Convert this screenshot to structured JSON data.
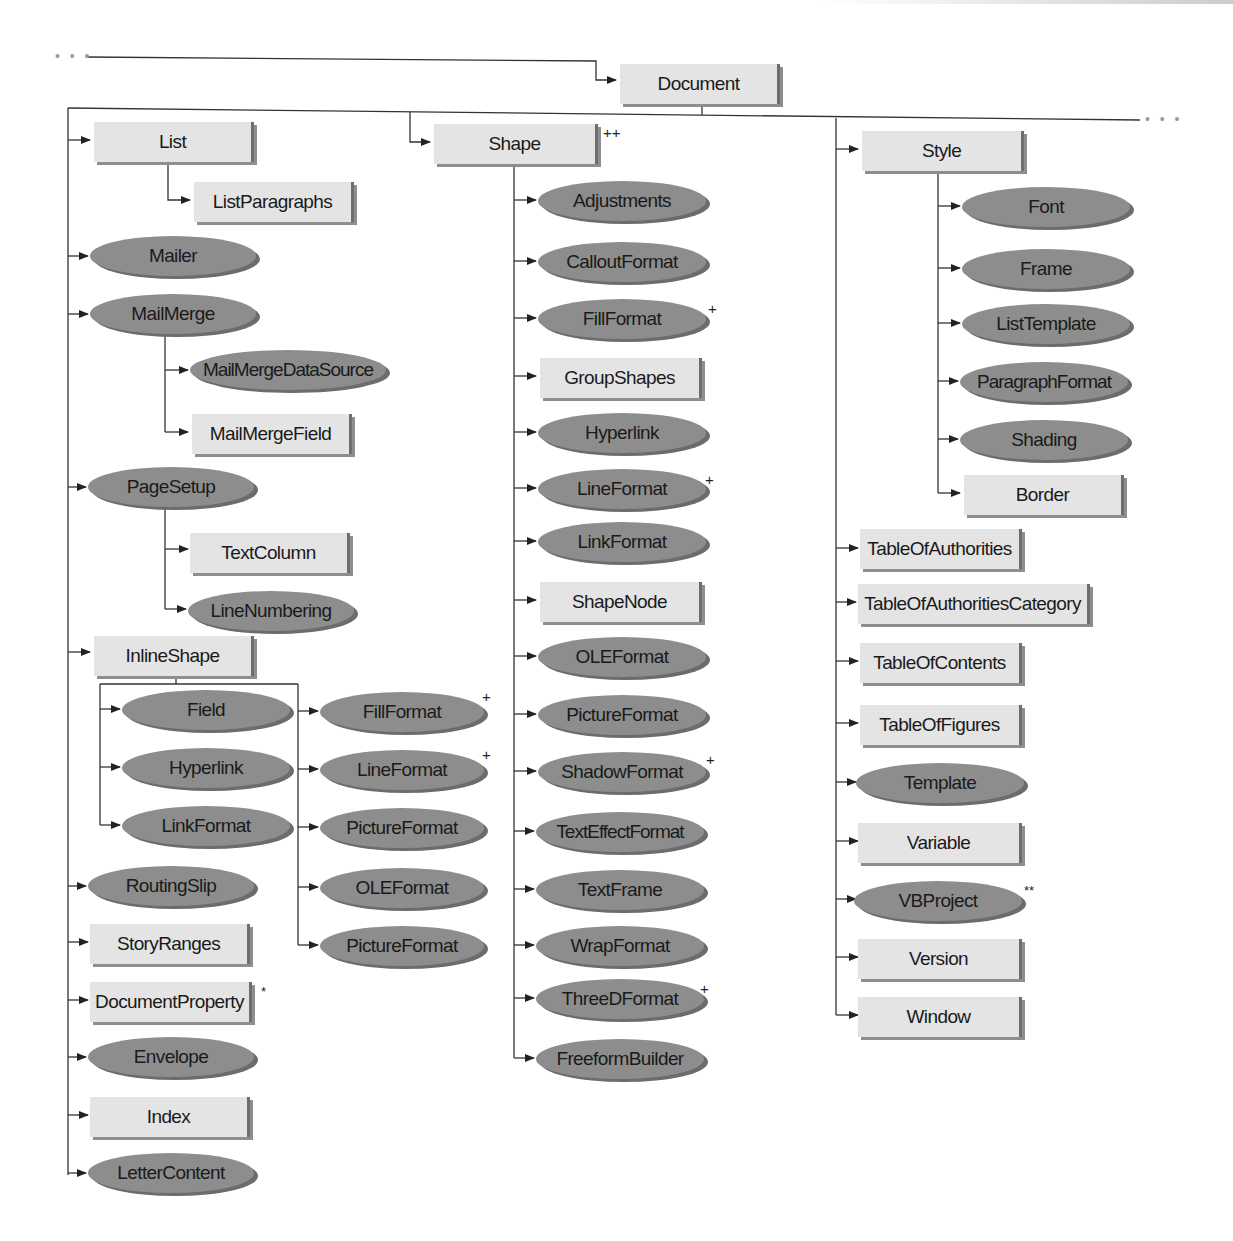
{
  "diagram": {
    "continuation_marker": "• • •",
    "root": {
      "label": "Document",
      "shape": "box"
    },
    "legend_marks": {
      "plus": "+",
      "double_plus": "++",
      "star": "*",
      "double_star": "**"
    },
    "left_column": {
      "list": {
        "label": "List",
        "shape": "box"
      },
      "list_paragraphs": {
        "label": "ListParagraphs",
        "shape": "box"
      },
      "mailer": {
        "label": "Mailer",
        "shape": "oval"
      },
      "mail_merge": {
        "label": "MailMerge",
        "shape": "oval"
      },
      "mail_merge_data_source": {
        "label": "MailMergeDataSource",
        "shape": "oval"
      },
      "mail_merge_field": {
        "label": "MailMergeField",
        "shape": "box"
      },
      "page_setup": {
        "label": "PageSetup",
        "shape": "oval"
      },
      "text_column": {
        "label": "TextColumn",
        "shape": "box"
      },
      "line_numbering": {
        "label": "LineNumbering",
        "shape": "oval"
      },
      "inline_shape": {
        "label": "InlineShape",
        "shape": "box"
      },
      "inline_field": {
        "label": "Field",
        "shape": "oval"
      },
      "inline_hyperlink": {
        "label": "Hyperlink",
        "shape": "oval"
      },
      "inline_link_format": {
        "label": "LinkFormat",
        "shape": "oval"
      },
      "inline_fill_format": {
        "label": "FillFormat",
        "shape": "oval",
        "mark": "+"
      },
      "inline_line_format": {
        "label": "LineFormat",
        "shape": "oval",
        "mark": "+"
      },
      "inline_picture_format": {
        "label": "PictureFormat",
        "shape": "oval"
      },
      "inline_ole_format": {
        "label": "OLEFormat",
        "shape": "oval"
      },
      "inline_picture_format_2": {
        "label": "PictureFormat",
        "shape": "oval"
      },
      "routing_slip": {
        "label": "RoutingSlip",
        "shape": "oval"
      },
      "story_ranges": {
        "label": "StoryRanges",
        "shape": "box"
      },
      "document_property": {
        "label": "DocumentProperty",
        "shape": "box",
        "mark": "*"
      },
      "envelope": {
        "label": "Envelope",
        "shape": "oval"
      },
      "index": {
        "label": "Index",
        "shape": "box"
      },
      "letter_content": {
        "label": "LetterContent",
        "shape": "oval"
      }
    },
    "middle_column": {
      "shape": {
        "label": "Shape",
        "shape": "box",
        "mark": "++"
      },
      "children": [
        {
          "label": "Adjustments",
          "shape": "oval"
        },
        {
          "label": "CalloutFormat",
          "shape": "oval"
        },
        {
          "label": "FillFormat",
          "shape": "oval",
          "mark": "+"
        },
        {
          "label": "GroupShapes",
          "shape": "box"
        },
        {
          "label": "Hyperlink",
          "shape": "oval"
        },
        {
          "label": "LineFormat",
          "shape": "oval",
          "mark": "+"
        },
        {
          "label": "LinkFormat",
          "shape": "oval"
        },
        {
          "label": "ShapeNode",
          "shape": "box"
        },
        {
          "label": "OLEFormat",
          "shape": "oval"
        },
        {
          "label": "PictureFormat",
          "shape": "oval"
        },
        {
          "label": "ShadowFormat",
          "shape": "oval",
          "mark": "+"
        },
        {
          "label": "TextEffectFormat",
          "shape": "oval"
        },
        {
          "label": "TextFrame",
          "shape": "oval"
        },
        {
          "label": "WrapFormat",
          "shape": "oval"
        },
        {
          "label": "ThreeDFormat",
          "shape": "oval",
          "mark": "+"
        },
        {
          "label": "FreeformBuilder",
          "shape": "oval"
        }
      ]
    },
    "right_column": {
      "style": {
        "label": "Style",
        "shape": "box"
      },
      "style_children": [
        {
          "label": "Font",
          "shape": "oval"
        },
        {
          "label": "Frame",
          "shape": "oval"
        },
        {
          "label": "ListTemplate",
          "shape": "oval"
        },
        {
          "label": "ParagraphFormat",
          "shape": "oval"
        },
        {
          "label": "Shading",
          "shape": "oval"
        },
        {
          "label": "Border",
          "shape": "box"
        }
      ],
      "items": [
        {
          "label": "TableOfAuthorities",
          "shape": "box"
        },
        {
          "label": "TableOfAuthoritiesCategory",
          "shape": "box"
        },
        {
          "label": "TableOfContents",
          "shape": "box"
        },
        {
          "label": "TableOfFigures",
          "shape": "box"
        },
        {
          "label": "Template",
          "shape": "oval"
        },
        {
          "label": "Variable",
          "shape": "box"
        },
        {
          "label": "VBProject",
          "shape": "oval",
          "mark": "**"
        },
        {
          "label": "Version",
          "shape": "box"
        },
        {
          "label": "Window",
          "shape": "box"
        }
      ]
    },
    "colors": {
      "box_fill": "#e4e4e4",
      "box_shadow": "#6e6e6e",
      "oval_fill": "#8d8d8d",
      "line": "#333333",
      "text": "#1a1a1a"
    }
  }
}
